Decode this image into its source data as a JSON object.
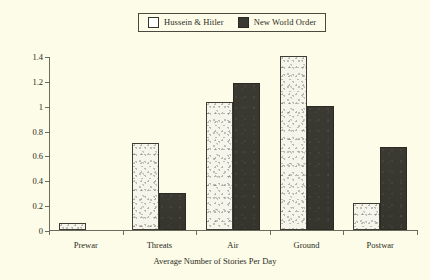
{
  "chart_data": {
    "type": "bar",
    "title": "",
    "subtitle": "",
    "xlabel": "Average Number of Stories Per Day",
    "ylabel": "",
    "categories": [
      "Prewar",
      "Threats",
      "Air",
      "Ground",
      "Postwar"
    ],
    "series": [
      {
        "name": "Hussein & Hitler",
        "values": [
          0.06,
          0.7,
          1.03,
          1.4,
          0.22
        ],
        "color": "#f6f5ec"
      },
      {
        "name": "New World Order",
        "values": [
          0.0,
          0.3,
          1.18,
          1.0,
          0.67
        ],
        "color": "#3a3a33"
      }
    ],
    "ylim": [
      0,
      1.4
    ],
    "yticks": [
      0,
      0.2,
      0.4,
      0.6,
      0.8,
      1,
      1.2,
      1.4
    ],
    "ytick_labels": [
      "0",
      "0.2",
      "0.4",
      "0.6",
      "0.8",
      "1",
      "1.2",
      "1.4"
    ],
    "grid": false,
    "legend_position": "top-center",
    "background_color": "#fdfce8",
    "axis_color": "#6c6c5e"
  },
  "legend": {
    "entries": [
      {
        "label": "Hussein & Hitler"
      },
      {
        "label": "New World Order"
      }
    ]
  }
}
